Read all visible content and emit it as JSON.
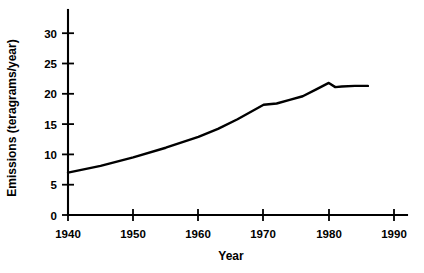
{
  "chart_data": {
    "type": "line",
    "title": "",
    "xlabel": "Year",
    "ylabel": "Emissions (teragrams/year)",
    "xlim": [
      1940,
      1990
    ],
    "ylim": [
      0,
      32
    ],
    "xticks": [
      1940,
      1950,
      1960,
      1970,
      1980,
      1990
    ],
    "xtick_labels": [
      "1940",
      "1950",
      "1960",
      "1970",
      "1980",
      "1990"
    ],
    "yticks": [
      0,
      5,
      10,
      15,
      20,
      25,
      30
    ],
    "ytick_labels": [
      "0",
      "5",
      "10",
      "15",
      "20",
      "25",
      "30"
    ],
    "grid": false,
    "legend": "none",
    "line_color": "#000000",
    "background_color": "#ffffff",
    "series": [
      {
        "name": "Emissions",
        "x": [
          1940,
          1945,
          1950,
          1955,
          1960,
          1963,
          1966,
          1970,
          1972,
          1974,
          1976,
          1978,
          1980,
          1981,
          1982,
          1984,
          1986
        ],
        "values": [
          7.0,
          8.1,
          9.5,
          11.1,
          12.9,
          14.2,
          15.8,
          18.2,
          18.4,
          19.0,
          19.6,
          20.7,
          21.8,
          21.1,
          21.2,
          21.3,
          21.3
        ]
      }
    ]
  },
  "axis": {
    "x_title": "Year",
    "y_title": "Emissions (teragrams/year)"
  }
}
